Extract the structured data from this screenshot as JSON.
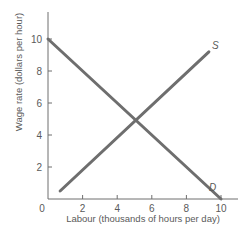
{
  "chart_data": {
    "type": "line",
    "title": "",
    "xlabel": "Labour (thousands of hours per day)",
    "ylabel": "Wage rate (dollars per hour)",
    "xlim": [
      0,
      10.5
    ],
    "ylim": [
      0,
      11.5
    ],
    "x_ticks": [
      2,
      4,
      6,
      8,
      10
    ],
    "y_ticks": [
      2,
      4,
      6,
      8,
      10
    ],
    "origin_label": "0",
    "grid": false,
    "legend": "none (curves labelled inline)",
    "series": [
      {
        "name": "S",
        "label": "S",
        "description": "Supply",
        "x": [
          0.7,
          9.3
        ],
        "y": [
          0.5,
          9.2
        ],
        "color": "#6e6e6e"
      },
      {
        "name": "D",
        "label": "D",
        "description": "Demand",
        "x": [
          0,
          10
        ],
        "y": [
          10,
          0
        ],
        "color": "#6e6e6e"
      }
    ],
    "equilibrium": {
      "x": 5,
      "y": 5
    }
  },
  "colors": {
    "axis": "#6e6e6e",
    "curve": "#6e6e6e",
    "text": "#5a5a5a"
  }
}
